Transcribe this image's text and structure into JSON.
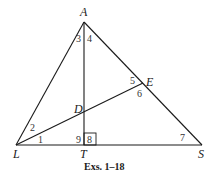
{
  "diagram": {
    "points": {
      "A": {
        "label": "A",
        "x": 84,
        "y": 22
      },
      "L": {
        "label": "L",
        "x": 16,
        "y": 145
      },
      "T": {
        "label": "T",
        "x": 84,
        "y": 145
      },
      "S": {
        "label": "S",
        "x": 202,
        "y": 145
      },
      "E": {
        "label": "E",
        "x": 143,
        "y": 83
      },
      "D": {
        "label": "D",
        "x": 84,
        "y": 111
      }
    },
    "segments": [
      "AL",
      "AS",
      "LS",
      "AT",
      "LE"
    ],
    "right_angle_at": "T",
    "angles": [
      {
        "label": "1",
        "x": 38,
        "y": 143
      },
      {
        "label": "2",
        "x": 30,
        "y": 131
      },
      {
        "label": "3",
        "x": 76,
        "y": 42
      },
      {
        "label": "4",
        "x": 87,
        "y": 42
      },
      {
        "label": "5",
        "x": 130,
        "y": 84
      },
      {
        "label": "6",
        "x": 137,
        "y": 97
      },
      {
        "label": "7",
        "x": 180,
        "y": 141
      },
      {
        "label": "8",
        "x": 87,
        "y": 143
      },
      {
        "label": "9",
        "x": 76,
        "y": 143
      }
    ],
    "caption": "Exs. 1–18"
  }
}
